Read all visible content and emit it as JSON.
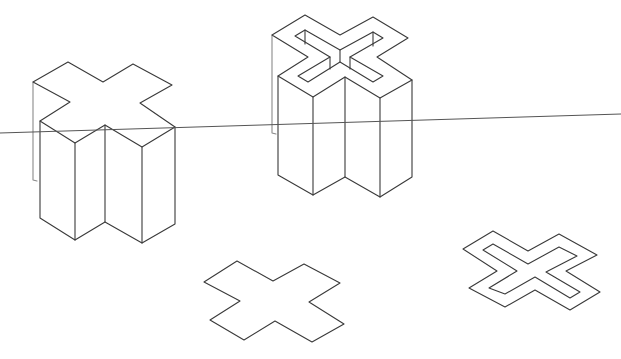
{
  "diagram": {
    "type": "isometric-line-drawing",
    "background": "#ffffff",
    "stroke_color": "#3a3a3a",
    "elements": [
      {
        "name": "solid-cross-prism",
        "description": "Solid extruded X-shaped cross prism, left"
      },
      {
        "name": "hollow-cross-prism",
        "description": "Extruded cross prism with hollow channel on top, center"
      },
      {
        "name": "flat-cross-outline",
        "description": "Flat X-shaped cross outline, bottom center"
      },
      {
        "name": "flat-hollow-cross-outline",
        "description": "Flat double-outline (hollow) X cross, bottom right"
      },
      {
        "name": "ground-line",
        "description": "Slanted horizontal reference line"
      }
    ]
  },
  "shapes": {
    "ground_line": {
      "x1": 0,
      "y1": 133,
      "x2": 621,
      "y2": 114
    },
    "solid_cross": {
      "top": "33,82 68,62 103,82 133,64 172,85 140,103 175,127 142,147 105,125 75,143 40,121 70,102 33,82",
      "back_left_edge": "33,82 33,180 37,181",
      "front": "40,121 40,218 75,240 105,222 142,243 175,224 175,127",
      "vert1": "75,143 75,240",
      "vert2": "105,125 105,222",
      "vert3": "142,147 142,243"
    },
    "hollow_cross": {
      "outer_top": "272,35 305,15 340,35 373,17 408,38 377,57 412,80 380,98 345,77 313,97 278,76 308,57 272,35",
      "inner_top": "295,36 305,30 340,50 373,32 383,38 350,57 383,76 373,82 340,62 308,82 298,76 330,57 295,36",
      "inner_vert1": "305,30 305,44",
      "inner_vert2": "373,32 373,46",
      "inner_vert3": "340,50 340,62",
      "inner_vert4": "330,57 330,69",
      "inner_vert5": "350,57 350,69",
      "back_left_edge": "272,35 272,133 276,134",
      "front": "278,76 278,175 313,195 345,177 380,197 412,177 412,80",
      "vert1": "313,97 313,195",
      "vert2": "345,77 345,177",
      "vert3": "380,98 380,197"
    },
    "flat_cross": "204,282 237,261 273,281 304,264 340,283 309,302 344,324 312,342 275,321 244,340 210,320 240,301 204,282",
    "flat_hollow_outer": "463,249 493,231 528,251 559,234 597,255 566,271 600,292 570,310 535,290 505,307 469,288 497,271 463,249",
    "flat_hollow_inner": "483,250 493,244 528,264 559,247 577,256 546,272 580,292 570,298 535,277 505,294 489,288 517,271 483,250"
  }
}
